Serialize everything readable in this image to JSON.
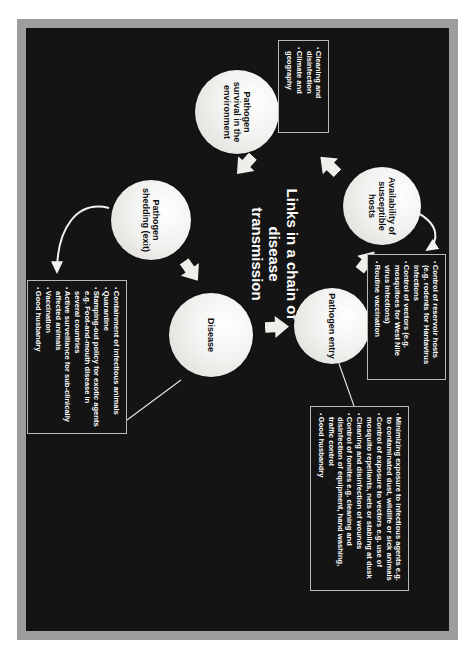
{
  "slide": {
    "title": "Links in a chain of disease transmission",
    "background_color": "#141414",
    "frame_color": "#9d9d9d",
    "node_color": "#f2f2f0",
    "accent_color": "#ffffff"
  },
  "nodes": [
    {
      "id": "availability-of-susceptible-hosts",
      "label": "Availability of susceptible hosts"
    },
    {
      "id": "pathogen-entry",
      "label": "Pathogen entry"
    },
    {
      "id": "disease",
      "label": "Disease"
    },
    {
      "id": "pathogen-shedding-exit",
      "label": "Pathogen shedding (exit)"
    },
    {
      "id": "pathogen-survival-in-the-environment",
      "label": "Pathogen survival in the environment"
    }
  ],
  "callouts": [
    {
      "id": "hosts-controls",
      "for_node": "availability-of-susceptible-hosts",
      "items": [
        "Control of reservoir hosts (e.g. rodents for Hantavirus infections",
        "Control of vectors (e.g. mosquitoes for West Nile virus infections)",
        "Routine vaccination"
      ]
    },
    {
      "id": "entry-controls",
      "for_node": "pathogen-entry",
      "items": [
        "Minimizing exposure to infectious agents e.g. to contaminated dust, wildlife or sick animals",
        "Control of exposure to vectors e.g. use of mosquito repellants, nets or stabling at dusk",
        "Cleaning and disinfection of wounds",
        "Control of fomites e.g. cleaning and disinfection of equipment, hand washing, traffic control",
        "Good husbandry"
      ]
    },
    {
      "id": "shedding-controls",
      "for_node": "pathogen-shedding-exit",
      "items": [
        "Containment of infectious animals",
        "Quarantine",
        "Stamping-out policy for exotic agents e.g. Foot-and-mouth disease in several countries",
        "Active surveillance for sub-clinically affected animals",
        "Vaccination",
        "Good husbandry"
      ]
    },
    {
      "id": "survival-controls",
      "for_node": "pathogen-survival-in-the-environment",
      "items": [
        "Cleaning and disinfection",
        "Climate and geography"
      ]
    }
  ]
}
